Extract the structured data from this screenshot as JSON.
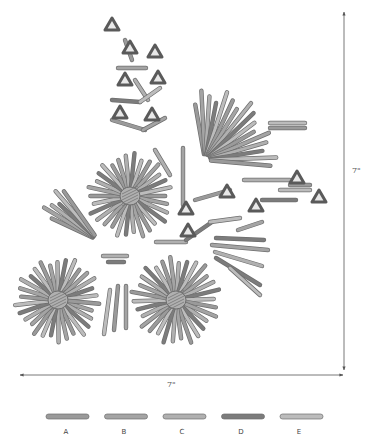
{
  "diagram": {
    "dimensions": {
      "width_label": "7\"",
      "height_label": "7\""
    },
    "colors": {
      "rod_A": "#9a9a9a",
      "rod_B": "#a4a4a4",
      "rod_C": "#b0b0b0",
      "rod_D": "#7c7c7c",
      "rod_E": "#bcbcbc",
      "rod_outline": "#6e6e6e",
      "triangle_connector": "#5a5a5a",
      "dimension_line": "#555555"
    },
    "legend": [
      {
        "key": "A",
        "label": "A"
      },
      {
        "key": "B",
        "label": "B"
      },
      {
        "key": "C",
        "label": "C"
      },
      {
        "key": "D",
        "label": "D"
      },
      {
        "key": "E",
        "label": "E"
      }
    ],
    "starbursts": [
      {
        "name": "starburst-upper",
        "cx": 130,
        "cy": 196,
        "r": 44,
        "count": 30
      },
      {
        "name": "starburst-lower-left",
        "cx": 58,
        "cy": 300,
        "r": 44,
        "count": 30
      },
      {
        "name": "starburst-lower-middle",
        "cx": 176,
        "cy": 300,
        "r": 46,
        "count": 30
      }
    ],
    "fans": [
      {
        "name": "fan-upper-right",
        "ox": 205,
        "oy": 160,
        "len": 75,
        "a0": -100,
        "a1": 5,
        "count": 16
      },
      {
        "name": "fan-left",
        "ox": 98,
        "oy": 240,
        "len": 68,
        "a0": 205,
        "a1": 235,
        "count": 6
      }
    ],
    "triangles": [
      [
        112,
        25
      ],
      [
        130,
        48
      ],
      [
        155,
        52
      ],
      [
        125,
        80
      ],
      [
        158,
        78
      ],
      [
        120,
        113
      ],
      [
        152,
        115
      ],
      [
        186,
        209
      ],
      [
        188,
        231
      ],
      [
        227,
        192
      ],
      [
        256,
        206
      ],
      [
        297,
        178
      ],
      [
        319,
        197
      ]
    ],
    "sticks": [
      [
        125,
        40,
        132,
        60
      ],
      [
        118,
        68,
        146,
        68
      ],
      [
        135,
        80,
        148,
        100
      ],
      [
        112,
        100,
        140,
        102
      ],
      [
        140,
        102,
        160,
        88
      ],
      [
        112,
        120,
        145,
        130
      ],
      [
        143,
        130,
        165,
        118
      ],
      [
        103,
        256,
        127,
        256
      ],
      [
        108,
        262,
        124,
        262
      ],
      [
        110,
        290,
        104,
        334
      ],
      [
        118,
        286,
        114,
        330
      ],
      [
        126,
        286,
        126,
        328
      ],
      [
        156,
        242,
        186,
        242
      ],
      [
        186,
        240,
        212,
        222
      ],
      [
        210,
        222,
        240,
        218
      ],
      [
        195,
        200,
        230,
        190
      ],
      [
        238,
        230,
        262,
        222
      ],
      [
        244,
        180,
        290,
        180
      ],
      [
        262,
        200,
        296,
        200
      ],
      [
        280,
        190,
        310,
        190
      ],
      [
        290,
        185,
        310,
        185
      ],
      [
        212,
        245,
        268,
        250
      ],
      [
        215,
        252,
        262,
        266
      ],
      [
        216,
        238,
        264,
        240
      ],
      [
        270,
        123,
        305,
        123
      ],
      [
        270,
        128,
        305,
        128
      ],
      [
        183,
        148,
        183,
        205
      ],
      [
        155,
        150,
        170,
        175
      ],
      [
        216,
        258,
        260,
        285
      ],
      [
        230,
        268,
        260,
        295
      ]
    ]
  }
}
